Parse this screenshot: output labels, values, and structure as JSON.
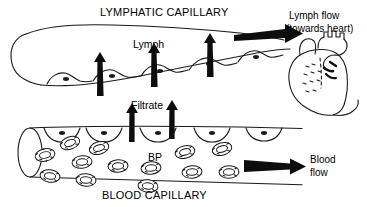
{
  "diagram": {
    "type": "biology-schematic",
    "background_color": "#ffffff",
    "ink_color": "#000000"
  },
  "labels": {
    "lymphatic_capillary": "LYMPHATIC CAPILLARY",
    "blood_capillary": "BLOOD CAPILLARY",
    "lymph": "Lymph",
    "filtrate": "Filtrate",
    "bp": "BP",
    "lymph_flow_line1": "Lymph flow",
    "lymph_flow_line2": "(towards heart)",
    "blood_flow_line1": "Blood",
    "blood_flow_line2": "flow"
  },
  "structures": [
    {
      "name": "lymphatic-capillary-vessel",
      "description": "blind-ended sac, rounded closed left end, widening to the right toward heart"
    },
    {
      "name": "lymphatic-endothelial-cells",
      "count": 5,
      "description": "overlapping flap cells with nuclei along lower wall"
    },
    {
      "name": "blood-capillary-vessel",
      "description": "horizontal cylinder, open elliptical cross-section at left"
    },
    {
      "name": "blood-capillary-endothelial-cells",
      "count": 5,
      "description": "cells with nuclei along upper wall"
    },
    {
      "name": "red-blood-cells",
      "count": 13,
      "description": "textured biconcave ellipses inside blood capillary"
    },
    {
      "name": "heart",
      "description": "hand-drawn heart with aortic arch and great vessels at right"
    }
  ],
  "arrows": [
    {
      "name": "lymph-uptake-arrow",
      "count": 3,
      "direction": "up",
      "meaning": "interstitial fluid entering lymphatic capillary"
    },
    {
      "name": "filtrate-arrow",
      "count": 2,
      "direction": "up",
      "meaning": "filtrate leaving blood capillary"
    },
    {
      "name": "lymph-flow-arrow",
      "direction": "right",
      "meaning": "lymph flow towards heart"
    },
    {
      "name": "blood-flow-arrow",
      "direction": "right",
      "meaning": "blood flow direction"
    }
  ]
}
